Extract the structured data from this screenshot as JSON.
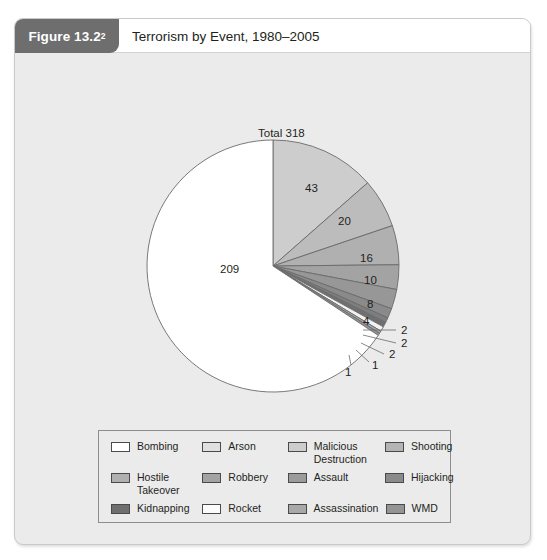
{
  "figure": {
    "badge_label": "Figure 13.2",
    "badge_superscript": "2",
    "title": "Terrorism by Event, 1980–2005"
  },
  "chart_data": {
    "type": "pie",
    "title": "Terrorism by Event, 1980–2005",
    "total_label": "Total 318",
    "total": 318,
    "categories": [
      "Bombing",
      "Arson",
      "Malicious Destruction",
      "Shooting",
      "Hostile Takeover",
      "Robbery",
      "Assault",
      "Hijacking",
      "Kidnapping",
      "Rocket",
      "Assassination",
      "WMD"
    ],
    "values": [
      209,
      43,
      20,
      16,
      10,
      8,
      4,
      2,
      2,
      2,
      1,
      1
    ],
    "slice_labels": [
      "209",
      "43",
      "20",
      "16",
      "10",
      "8",
      "4",
      "2",
      "2",
      "2",
      "1",
      "1"
    ],
    "colors": [
      "#ffffff",
      "#cdcdcd",
      "#bcbcbc",
      "#b0b0b0",
      "#a3a3a3",
      "#979797",
      "#8a8a8a",
      "#7e7e7e",
      "#6f6f6f",
      "#f2f2f2",
      "#a8a8a8",
      "#949494"
    ],
    "start_angle_deg": 0,
    "direction": "clockwise",
    "legend_position": "bottom",
    "grid": false,
    "xlabel": "",
    "ylabel": ""
  },
  "pie_slice_annotations": [
    {
      "text": "209",
      "x": 205,
      "y": 211,
      "leader": false
    },
    {
      "text": "43",
      "x": 290,
      "y": 130,
      "leader": false
    },
    {
      "text": "20",
      "x": 323,
      "y": 163,
      "leader": false
    },
    {
      "text": "16",
      "x": 345,
      "y": 200,
      "leader": false
    },
    {
      "text": "10",
      "x": 349,
      "y": 222,
      "leader": false
    },
    {
      "text": "8",
      "x": 352,
      "y": 246,
      "leader": false
    },
    {
      "text": "4",
      "x": 348,
      "y": 263,
      "leader": false
    },
    {
      "text": "2",
      "x": 386,
      "y": 272,
      "leader": true
    },
    {
      "text": "2",
      "x": 386,
      "y": 285,
      "leader": true
    },
    {
      "text": "2",
      "x": 374,
      "y": 296,
      "leader": true
    },
    {
      "text": "1",
      "x": 357,
      "y": 307,
      "leader": true
    },
    {
      "text": "1",
      "x": 330,
      "y": 314,
      "leader": true
    }
  ],
  "legend": {
    "rows": [
      [
        {
          "label": "Bombing",
          "color": "#ffffff"
        },
        {
          "label": "Arson",
          "color": "#e0e0e0"
        },
        {
          "label": "Malicious\nDestruction",
          "color": "#cdcdcd"
        },
        {
          "label": "Shooting",
          "color": "#b4b4b4"
        }
      ],
      [
        {
          "label": "Hostile\nTakeover",
          "color": "#b0b0b0"
        },
        {
          "label": "Robbery",
          "color": "#a3a3a3"
        },
        {
          "label": "Assault",
          "color": "#9b9b9b"
        },
        {
          "label": "Hijacking",
          "color": "#8a8a8a"
        }
      ],
      [
        {
          "label": "Kidnapping",
          "color": "#6f6f6f"
        },
        {
          "label": "Rocket",
          "color": "#fbfbfb"
        },
        {
          "label": "Assassination",
          "color": "#a8a8a8"
        },
        {
          "label": "WMD",
          "color": "#949494"
        }
      ]
    ]
  }
}
